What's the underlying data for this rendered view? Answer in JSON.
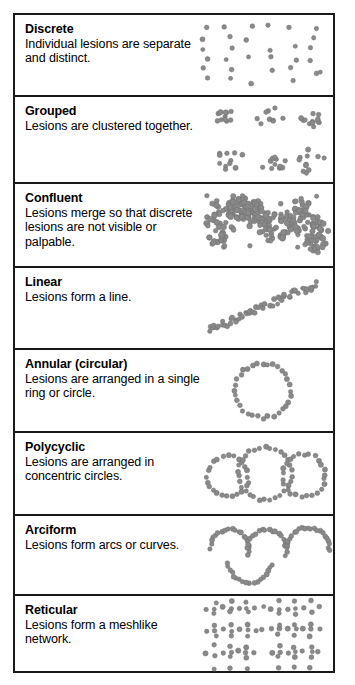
{
  "figure": {
    "dot_color": "#8a8a8a",
    "dot_edge_color": "#6f6f6f",
    "border_color": "#1a1a1a",
    "background": "#ffffff"
  },
  "rows": [
    {
      "id": "discrete",
      "title": "Discrete",
      "description": "Individual lesions are separate and distinct.",
      "pattern": "scatter-grid",
      "height": 82
    },
    {
      "id": "grouped",
      "title": "Grouped",
      "description": "Lesions are clustered together.",
      "pattern": "clusters",
      "height": 87
    },
    {
      "id": "confluent",
      "title": "Confluent",
      "description": "Lesions merge so that discrete lesions are not visible or palpable.",
      "pattern": "confluent-mass",
      "height": 84
    },
    {
      "id": "linear",
      "title": "Linear",
      "description": "Lesions form a line.",
      "pattern": "diagonal-band",
      "height": 82
    },
    {
      "id": "annular",
      "title": "Annular (circular)",
      "description": "Lesions are arranged in a single ring or circle.",
      "pattern": "single-ring",
      "height": 83
    },
    {
      "id": "polycyclic",
      "title": "Polycyclic",
      "description": "Lesions are arranged in concentric circles.",
      "pattern": "ring-chain",
      "height": 83
    },
    {
      "id": "arciform",
      "title": "Arciform",
      "description": "Lesions form arcs or curves.",
      "pattern": "arcs",
      "height": 80
    },
    {
      "id": "reticular",
      "title": "Reticular",
      "description": "Lesions form a meshlike network.",
      "pattern": "mesh",
      "height": 79
    }
  ]
}
